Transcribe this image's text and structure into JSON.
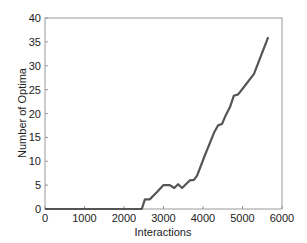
{
  "chart_data": {
    "type": "line",
    "title": "",
    "xlabel": "Interactions",
    "ylabel": "Number of Optima",
    "xlim": [
      0,
      6000
    ],
    "ylim": [
      0,
      40
    ],
    "xticks": [
      0,
      1000,
      2000,
      3000,
      4000,
      5000,
      6000
    ],
    "yticks": [
      0,
      5,
      10,
      15,
      20,
      25,
      30,
      35,
      40
    ],
    "grid": false,
    "legend": null,
    "series": [
      {
        "name": "Number of Optima",
        "color": "#555555",
        "x": [
          0,
          2450,
          2530,
          2650,
          2830,
          3000,
          3160,
          3270,
          3370,
          3470,
          3670,
          3770,
          3850,
          4050,
          4280,
          4380,
          4480,
          4580,
          4680,
          4780,
          4890,
          5060,
          5290,
          5650
        ],
        "y": [
          0,
          0,
          2,
          2,
          3.5,
          5,
          5,
          4.4,
          5.2,
          4.4,
          6,
          6.1,
          7,
          11.3,
          16,
          17.5,
          17.8,
          19.7,
          21.3,
          23.7,
          24,
          25.8,
          28.3,
          36
        ]
      }
    ]
  }
}
